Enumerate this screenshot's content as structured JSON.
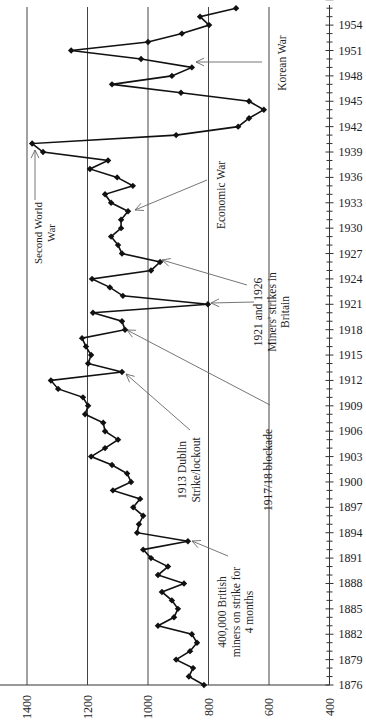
{
  "chart_data": {
    "type": "line",
    "orientation": "rotated-90 (years run vertically bottom-to-top, values run horizontally right-to-left)",
    "title": "",
    "xlabel": "",
    "ylabel": "",
    "x_axis": {
      "label": "Year",
      "range": [
        1876,
        1957
      ],
      "tick_labels": [
        "1876",
        "1879",
        "1882",
        "1885",
        "1888",
        "1891",
        "1894",
        "1897",
        "1900",
        "1903",
        "1906",
        "1909",
        "1912",
        "1915",
        "1918",
        "1921",
        "1924",
        "1927",
        "1930",
        "1933",
        "1936",
        "1939",
        "1942",
        "1945",
        "1948",
        "1951",
        "1954"
      ],
      "minor_ticks": "every year"
    },
    "y_axis": {
      "range": [
        400,
        1400
      ],
      "tick_labels": [
        "1400",
        "1200",
        "1000",
        "800",
        "600",
        "400"
      ],
      "gridlines": [
        1400,
        1200,
        1000,
        800,
        600
      ]
    },
    "grid": true,
    "legend": null,
    "series": [
      {
        "name": "value",
        "marker": "diamond",
        "x": [
          1876,
          1877,
          1878,
          1879,
          1880,
          1881,
          1882,
          1883,
          1884,
          1885,
          1886,
          1887,
          1888,
          1889,
          1890,
          1891,
          1892,
          1893,
          1894,
          1895,
          1896,
          1897,
          1898,
          1899,
          1900,
          1901,
          1902,
          1903,
          1904,
          1905,
          1906,
          1907,
          1908,
          1909,
          1910,
          1911,
          1912,
          1913,
          1914,
          1915,
          1916,
          1917,
          1918,
          1919,
          1920,
          1921,
          1922,
          1923,
          1924,
          1925,
          1926,
          1927,
          1928,
          1929,
          1930,
          1931,
          1932,
          1933,
          1934,
          1935,
          1936,
          1937,
          1938,
          1939,
          1940,
          1941,
          1942,
          1943,
          1944,
          1945,
          1946,
          1947,
          1948,
          1949,
          1950,
          1951,
          1952,
          1953,
          1954,
          1955,
          1956
        ],
        "values": [
          815,
          865,
          851,
          907,
          861,
          838,
          855,
          967,
          914,
          901,
          921,
          954,
          881,
          967,
          934,
          990,
          1016,
          868,
          1036,
          1030,
          1016,
          1049,
          1026,
          1116,
          1056,
          1069,
          1119,
          1188,
          1142,
          1099,
          1142,
          1148,
          1208,
          1198,
          1215,
          1297,
          1321,
          1086,
          1198,
          1188,
          1205,
          1218,
          1076,
          1086,
          1182,
          802,
          1083,
          1126,
          1185,
          990,
          960,
          1086,
          1099,
          1122,
          1089,
          1089,
          1066,
          1122,
          1142,
          1050,
          1102,
          1192,
          1132,
          1347,
          1383,
          907,
          702,
          666,
          617,
          666,
          891,
          1119,
          921,
          855,
          1023,
          1254,
          1000,
          888,
          798,
          828,
          709
        ]
      }
    ],
    "annotations": [
      {
        "text_lines": [
          "400,000 British",
          "miners on strike for",
          "4 months"
        ],
        "points_to_year": 1893
      },
      {
        "text_lines": [
          "1913  Dublin",
          "Strike/lockout"
        ],
        "points_to_year": 1913
      },
      {
        "text_lines": [
          "1917/18 blockade"
        ],
        "points_to_year": 1918
      },
      {
        "text_lines": [
          "1921 and 1926",
          "Miners' strikes in",
          "Britain"
        ],
        "points_to_year": [
          1921,
          1926
        ]
      },
      {
        "text_lines": [
          "Economic War"
        ],
        "points_to_year": 1932
      },
      {
        "text_lines": [
          "Second World",
          "War"
        ],
        "points_to_year": 1939
      },
      {
        "text_lines": [
          "Korean War"
        ],
        "points_to_year": 1950
      }
    ]
  }
}
